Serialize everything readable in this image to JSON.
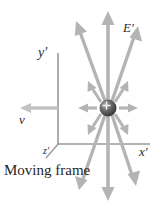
{
  "figure": {
    "caption": "Moving frame",
    "background_color": "#ffffff",
    "labels": {
      "y_axis": "y′",
      "x_axis": "x′",
      "z_axis": "z′",
      "velocity": "v",
      "field": "E′"
    },
    "colors": {
      "axis": "#9a9a9a",
      "field_arrow": "#b4b4b4",
      "velocity_arrow": "#c0c0c0",
      "charge_fill": "#4a4a4a",
      "charge_highlight": "#9d9d9d",
      "text": "#2b2b2b"
    },
    "charge": {
      "sign": "+",
      "center_x": 108,
      "center_y": 108,
      "radius": 8
    },
    "axes": {
      "y_axis_from": [
        58,
        144
      ],
      "y_axis_to": [
        58,
        53
      ],
      "x_axis_from": [
        58,
        144
      ],
      "x_axis_to": [
        150,
        144
      ],
      "z_axis_from": [
        58,
        144
      ],
      "z_axis_to": [
        46,
        158
      ]
    },
    "velocity_arrow": {
      "from": [
        58,
        108
      ],
      "to": [
        22,
        108
      ]
    },
    "field_arrows": [
      {
        "name": "up",
        "angle_deg": 90,
        "length": 96,
        "head": "large"
      },
      {
        "name": "up-left",
        "angle_deg": 112,
        "length": 92,
        "head": "large"
      },
      {
        "name": "up-right",
        "angle_deg": 68,
        "length": 92,
        "head": "large"
      },
      {
        "name": "up-left-far",
        "angle_deg": 128,
        "length": 30,
        "head": "small"
      },
      {
        "name": "up-right-far",
        "angle_deg": 52,
        "length": 30,
        "head": "small"
      },
      {
        "name": "left",
        "angle_deg": 180,
        "length": 28,
        "head": "small"
      },
      {
        "name": "right",
        "angle_deg": 0,
        "length": 28,
        "head": "small"
      },
      {
        "name": "down-left-far",
        "angle_deg": -128,
        "length": 30,
        "head": "small"
      },
      {
        "name": "down-right-far",
        "angle_deg": -52,
        "length": 30,
        "head": "small"
      },
      {
        "name": "down-left",
        "angle_deg": -112,
        "length": 92,
        "head": "large"
      },
      {
        "name": "down",
        "angle_deg": -90,
        "length": 96,
        "head": "large"
      },
      {
        "name": "down-right",
        "angle_deg": -68,
        "length": 92,
        "head": "large"
      }
    ]
  }
}
